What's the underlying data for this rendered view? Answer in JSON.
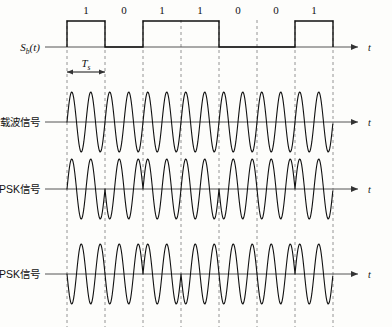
{
  "figure": {
    "time_axis_label": "t",
    "period_label": "T",
    "period_sub": "s",
    "baseband_label": "S",
    "baseband_sub": "b",
    "baseband_suffix": "(t)"
  },
  "rows": [
    {
      "id": "baseband",
      "label": ""
    },
    {
      "id": "carrier",
      "label": "载波信号"
    },
    {
      "id": "psk",
      "label": "2PSK信号"
    },
    {
      "id": "dpsk",
      "label": "2DPSK信号"
    }
  ],
  "bits": [
    {
      "index": 0,
      "value": "1"
    },
    {
      "index": 1,
      "value": "0"
    },
    {
      "index": 2,
      "value": "1"
    },
    {
      "index": 3,
      "value": "1"
    },
    {
      "index": 4,
      "value": "0"
    },
    {
      "index": 5,
      "value": "0"
    },
    {
      "index": 6,
      "value": "1"
    }
  ],
  "chart_data": {
    "type": "line",
    "xlabel": "t",
    "ylabel": "",
    "grid": false,
    "legend": "none",
    "bit_sequence": [
      1,
      0,
      1,
      1,
      0,
      0,
      1
    ],
    "bit_period_px": 38,
    "first_boundary_px": 67,
    "carrier_cycles_per_bit": 2,
    "series": [
      {
        "name": "Sb(t)",
        "type": "square",
        "values": [
          1,
          0,
          1,
          1,
          0,
          0,
          1
        ],
        "description": "NRZ baseband binary pulse train"
      },
      {
        "name": "载波信号",
        "type": "sine",
        "phase_per_bit": [
          0,
          0,
          0,
          0,
          0,
          0,
          0
        ],
        "description": "Unmodulated continuous carrier"
      },
      {
        "name": "2PSK信号",
        "type": "sine",
        "phase_per_bit": [
          0,
          180,
          0,
          0,
          180,
          180,
          0
        ],
        "description": "Absolute phase shift keying: phase 0 for bit 1, phase 180 for bit 0"
      },
      {
        "name": "2DPSK信号",
        "type": "sine",
        "phase_per_bit": [
          180,
          180,
          0,
          180,
          180,
          180,
          0
        ],
        "description": "Differential phase shift keying: phase changes by 180 when bit is 1, unchanged when bit is 0"
      }
    ],
    "annotations": [
      {
        "text": "T",
        "sub": "s",
        "kind": "bit-period-marker"
      }
    ]
  },
  "colors": {
    "line": "#111111",
    "axis": "#555555",
    "dashed_guide": "#888888",
    "background": "#fdfdfb"
  }
}
